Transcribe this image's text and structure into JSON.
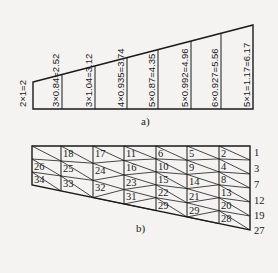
{
  "figure_a": {
    "caption": "a)",
    "column_labels": [
      "2×1=2",
      "3×0.84=2.52",
      "3×1.04=3.12",
      "4×0.935=3.74",
      "5×0.87=4.35",
      "5×0.992=4.96",
      "6×0.927=5.56",
      "5×1=1.17=6.17"
    ]
  },
  "figure_b": {
    "caption": "b)",
    "node_labels": [
      {
        "text": "26",
        "col": 0,
        "row": 1
      },
      {
        "text": "34",
        "col": 0,
        "row": 2
      },
      {
        "text": "18",
        "col": 1,
        "row": 0
      },
      {
        "text": "25",
        "col": 1,
        "row": 1
      },
      {
        "text": "33",
        "col": 1,
        "row": 2
      },
      {
        "text": "17",
        "col": 2,
        "row": 0
      },
      {
        "text": "24",
        "col": 2,
        "row": 1
      },
      {
        "text": "32",
        "col": 2,
        "row": 2
      },
      {
        "text": "11",
        "col": 3,
        "row": 0
      },
      {
        "text": "16",
        "col": 3,
        "row": 1
      },
      {
        "text": "23",
        "col": 3,
        "row": 2
      },
      {
        "text": "31",
        "col": 3,
        "row": 3
      },
      {
        "text": "6",
        "col": 4,
        "row": 0
      },
      {
        "text": "10",
        "col": 4,
        "row": 1
      },
      {
        "text": "15",
        "col": 4,
        "row": 2
      },
      {
        "text": "22",
        "col": 4,
        "row": 3
      },
      {
        "text": "29",
        "col": 4,
        "row": 4
      },
      {
        "text": "5",
        "col": 5,
        "row": 0
      },
      {
        "text": "9",
        "col": 5,
        "row": 1
      },
      {
        "text": "14",
        "col": 5,
        "row": 2
      },
      {
        "text": "21",
        "col": 5,
        "row": 3
      },
      {
        "text": "29",
        "col": 5,
        "row": 4
      },
      {
        "text": "2",
        "col": 6,
        "row": 0
      },
      {
        "text": "4",
        "col": 6,
        "row": 1
      },
      {
        "text": "8",
        "col": 6,
        "row": 2
      },
      {
        "text": "13",
        "col": 6,
        "row": 3
      },
      {
        "text": "20",
        "col": 6,
        "row": 4
      },
      {
        "text": "28",
        "col": 6,
        "row": 5
      }
    ],
    "right_edge_labels": [
      "1",
      "3",
      "7",
      "12",
      "19",
      "27"
    ]
  }
}
